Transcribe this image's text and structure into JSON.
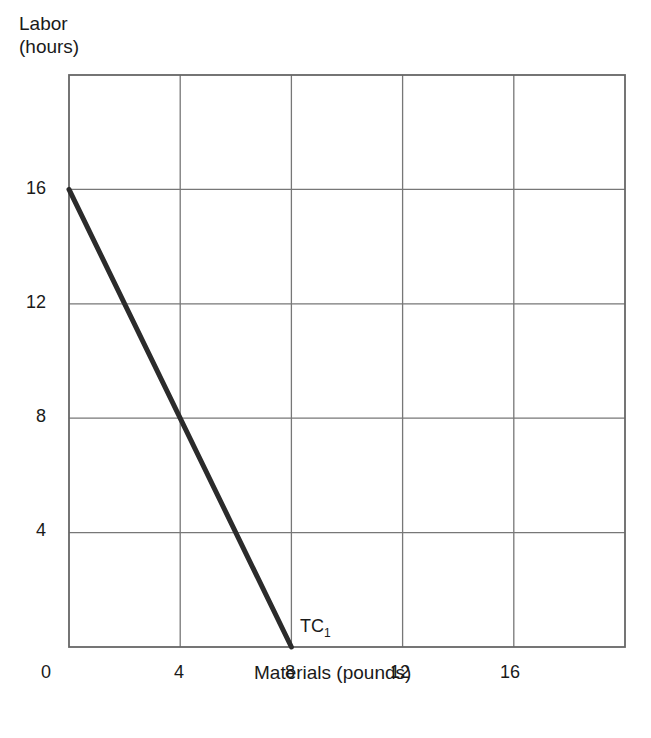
{
  "chart_data": {
    "type": "line",
    "title": "",
    "xlabel": "Materials (pounds)",
    "ylabel_line1": "Labor",
    "ylabel_line2": "(hours)",
    "xlim": [
      0,
      20
    ],
    "ylim": [
      0,
      20
    ],
    "x_ticks": [
      "0",
      "4",
      "8",
      "12",
      "16"
    ],
    "y_ticks": [
      "4",
      "8",
      "12",
      "16"
    ],
    "grid": true,
    "legend": "none",
    "series": [
      {
        "name": "TC",
        "label_main": "TC",
        "label_sub": "1",
        "x": [
          0,
          8
        ],
        "y": [
          16,
          0
        ]
      }
    ]
  }
}
